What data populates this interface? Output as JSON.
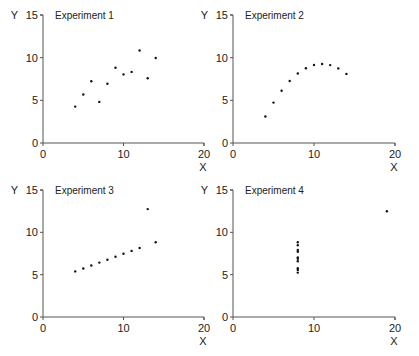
{
  "chart_data": [
    {
      "type": "scatter",
      "title": "Experiment 1",
      "xlabel": "X",
      "ylabel": "Y",
      "xlim": [
        0,
        20
      ],
      "ylim": [
        0,
        15
      ],
      "xticks": [
        "0",
        "10",
        "20"
      ],
      "yticks": [
        "0",
        "5",
        "10",
        "15"
      ],
      "grid": false,
      "x": [
        10,
        8,
        13,
        9,
        11,
        14,
        6,
        4,
        12,
        7,
        5
      ],
      "y": [
        8.04,
        6.95,
        7.58,
        8.81,
        8.33,
        9.96,
        7.24,
        4.26,
        10.84,
        4.82,
        5.68
      ]
    },
    {
      "type": "scatter",
      "title": "Experiment 2",
      "xlabel": "X",
      "ylabel": "Y",
      "xlim": [
        0,
        20
      ],
      "ylim": [
        0,
        15
      ],
      "xticks": [
        "0",
        "10",
        "20"
      ],
      "yticks": [
        "0",
        "5",
        "10",
        "15"
      ],
      "grid": false,
      "x": [
        10,
        8,
        13,
        9,
        11,
        14,
        6,
        4,
        12,
        7,
        5
      ],
      "y": [
        9.14,
        8.14,
        8.74,
        8.77,
        9.26,
        8.1,
        6.13,
        3.1,
        9.13,
        7.26,
        4.74
      ]
    },
    {
      "type": "scatter",
      "title": "Experiment 3",
      "xlabel": "X",
      "ylabel": "Y",
      "xlim": [
        0,
        20
      ],
      "ylim": [
        0,
        15
      ],
      "xticks": [
        "0",
        "10",
        "20"
      ],
      "yticks": [
        "0",
        "5",
        "10",
        "15"
      ],
      "grid": false,
      "x": [
        10,
        8,
        13,
        9,
        11,
        14,
        6,
        4,
        12,
        7,
        5
      ],
      "y": [
        7.46,
        6.77,
        12.74,
        7.11,
        7.81,
        8.84,
        6.08,
        5.39,
        8.15,
        6.42,
        5.73
      ]
    },
    {
      "type": "scatter",
      "title": "Experiment 4",
      "xlabel": "X",
      "ylabel": "Y",
      "xlim": [
        0,
        20
      ],
      "ylim": [
        0,
        15
      ],
      "xticks": [
        "0",
        "10",
        "20"
      ],
      "yticks": [
        "0",
        "5",
        "10",
        "15"
      ],
      "grid": false,
      "x": [
        8,
        8,
        8,
        8,
        8,
        8,
        8,
        19,
        8,
        8,
        8
      ],
      "y": [
        6.58,
        5.76,
        7.71,
        8.84,
        8.47,
        7.04,
        5.25,
        12.5,
        5.56,
        7.91,
        6.89
      ]
    }
  ],
  "panels": [
    {
      "title": "Experiment 1",
      "xlabel": "X",
      "ylabel": "Y"
    },
    {
      "title": "Experiment 2",
      "xlabel": "X",
      "ylabel": "Y"
    },
    {
      "title": "Experiment 3",
      "xlabel": "X",
      "ylabel": "Y"
    },
    {
      "title": "Experiment 4",
      "xlabel": "X",
      "ylabel": "Y"
    }
  ]
}
